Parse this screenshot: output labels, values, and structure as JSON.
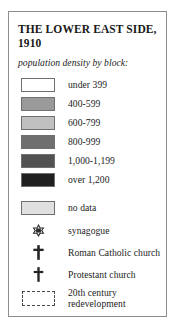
{
  "legend": {
    "title": "THE LOWER EAST SIDE, 1910",
    "subtitle": "population density by block:",
    "frame_color": "#8d8d8d",
    "density_items": [
      {
        "label": "under 399",
        "color": "#ffffff",
        "swatch_name": "swatch-under-399"
      },
      {
        "label": "400-599",
        "color": "#9a9a9a",
        "swatch_name": "swatch-400-599"
      },
      {
        "label": "600-799",
        "color": "#c0c0c0",
        "swatch_name": "swatch-600-799"
      },
      {
        "label": "800-999",
        "color": "#6f6f6f",
        "swatch_name": "swatch-800-999"
      },
      {
        "label": "1,000-1,199",
        "color": "#525252",
        "swatch_name": "swatch-1000-1199"
      },
      {
        "label": "over 1,200",
        "color": "#1f1f1f",
        "swatch_name": "swatch-over-1200"
      }
    ],
    "no_data": {
      "label": "no data",
      "color": "#e0e0e0"
    },
    "symbol_items": [
      {
        "label": "synagogue",
        "icon": "star-of-david-icon"
      },
      {
        "label": "Roman Catholic church",
        "icon": "latin-cross-icon"
      },
      {
        "label": "Protestant church",
        "icon": "latin-cross-icon"
      }
    ],
    "redevelopment": {
      "line1": "20th century",
      "line2": "redevelopment",
      "icon": "dashed-rectangle-icon"
    }
  }
}
